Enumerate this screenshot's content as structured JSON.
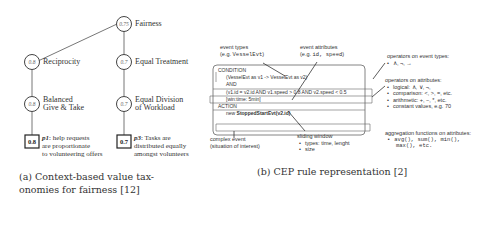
{
  "figure_a": {
    "root": {
      "value": "0.75",
      "label": "Fairness"
    },
    "left_branch": {
      "level1": {
        "value": "0.8",
        "label": "Reciprocity"
      },
      "level2": {
        "value": "0.8",
        "label_line1": "Balanced",
        "label_line2": "Give & Take"
      },
      "leaf": {
        "value": "0.8",
        "prop_id": "p1",
        "prop_line1": ": help requests",
        "prop_line2": "are proportionate",
        "prop_line3": "to volunteering offers"
      }
    },
    "right_branch": {
      "level1": {
        "value": "0.7",
        "label": "Equal Treatment"
      },
      "level2": {
        "value": "0.7",
        "label_line1": "Equal Division",
        "label_line2": "of Workload"
      },
      "leaf": {
        "value": "0.7",
        "prop_id": "p3",
        "prop_line1": ": Tasks are",
        "prop_line2": "distributed equally",
        "prop_line3": "amongst volunteers"
      }
    },
    "caption_line1": "(a)   Context-based   value   tax-",
    "caption_line2": "onomies for fairness [12]"
  },
  "figure_b": {
    "event_types": {
      "title": "event types",
      "eg_prefix": "(e.g. ",
      "eg_code": "VesselEvt",
      "eg_suffix": ")"
    },
    "event_attributes": {
      "title": "event attributes",
      "eg_prefix": "(e.g. ",
      "eg_code": "id, speed",
      "eg_suffix": ")"
    },
    "rule": {
      "condition_label": "CONDITION",
      "condition_expr": "(VesselEvt as v1 -> VesselEvt as v2)",
      "and_label": "AND",
      "where_expr": "(v1.id = v2.id AND v1.speed > 0.8 AND v2.speed < 0.5",
      "window_expr": "[win:time: 5min]",
      "action_label": "ACTION",
      "action_prefix": "new ",
      "action_expr": "StoppedStartEvt(v2.id)"
    },
    "complex_event": {
      "line1": "complex event",
      "line2": "(situation of interest)"
    },
    "sliding_window": {
      "title": "sliding window",
      "items": [
        "types: time, lenght",
        "size"
      ]
    },
    "ops_event_types": {
      "title": "operators on event types:",
      "items": [
        "∧,  ¬,  →"
      ]
    },
    "ops_attributes": {
      "title": "operators on attributes:",
      "items": [
        "logical:  ∧,  ∨,  ¬,",
        "comparison: <,  >,  =,  etc.",
        "arithmetic: +,  −,  *,  etc.",
        "constant values, e.g. 70"
      ]
    },
    "aggregation": {
      "title": "aggregation functions on attributes:",
      "line1": "avg(), sum(), min(),",
      "line2": "max(), etc."
    },
    "caption": "(b) CEP rule representation [2]"
  }
}
